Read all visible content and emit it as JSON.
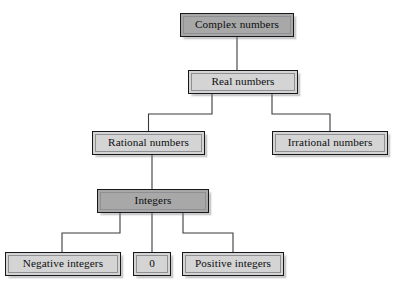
{
  "diagram": {
    "colors": {
      "fill_light": "#d4d4d4",
      "fill_dark": "#a8a8a8",
      "border": "#17181a",
      "inner_border": "#8e9094",
      "connector": "#3b3b3d",
      "background": "#ffffff",
      "text": "#0d0d0f"
    },
    "nodes": [
      {
        "id": "complex-numbers",
        "label": "Complex numbers",
        "shade": "dark",
        "x": 180,
        "y": 13,
        "w": 114,
        "h": 24
      },
      {
        "id": "real-numbers",
        "label": "Real numbers",
        "shade": "light",
        "x": 188,
        "y": 70,
        "w": 110,
        "h": 24
      },
      {
        "id": "rational-numbers",
        "label": "Rational numbers",
        "shade": "light",
        "x": 92,
        "y": 131,
        "w": 113,
        "h": 24
      },
      {
        "id": "irrational-numbers",
        "label": "Irrational numbers",
        "shade": "light",
        "x": 272,
        "y": 131,
        "w": 116,
        "h": 24
      },
      {
        "id": "integers",
        "label": "Integers",
        "shade": "dark",
        "x": 97,
        "y": 189,
        "w": 112,
        "h": 24
      },
      {
        "id": "negative-integers",
        "label": "Negative integers",
        "shade": "light",
        "x": 5,
        "y": 252,
        "w": 116,
        "h": 24
      },
      {
        "id": "zero",
        "label": "0",
        "shade": "light",
        "x": 133,
        "y": 252,
        "w": 38,
        "h": 24
      },
      {
        "id": "positive-integers",
        "label": "Positive integers",
        "shade": "light",
        "x": 182,
        "y": 252,
        "w": 102,
        "h": 24
      }
    ],
    "edges": [
      {
        "from": "complex-numbers",
        "to": "real-numbers",
        "path": "M 237,37 L 237,70"
      },
      {
        "from": "real-numbers",
        "to": "rational-numbers",
        "path": "M 212,94 L 212,114 L 148.5,114 L 148.5,131"
      },
      {
        "from": "real-numbers",
        "to": "irrational-numbers",
        "path": "M 272,94 L 272,114 L 330,114 L 330,131"
      },
      {
        "from": "rational-numbers",
        "to": "integers",
        "path": "M 152,155 L 152,189"
      },
      {
        "from": "integers",
        "to": "negative-integers",
        "path": "M 120,213 L 120,233 L 62,233 L 62,252"
      },
      {
        "from": "integers",
        "to": "zero",
        "path": "M 152,213 L 152,252"
      },
      {
        "from": "integers",
        "to": "positive-integers",
        "path": "M 183,213 L 183,233 L 233,233 L 233,252"
      }
    ]
  }
}
